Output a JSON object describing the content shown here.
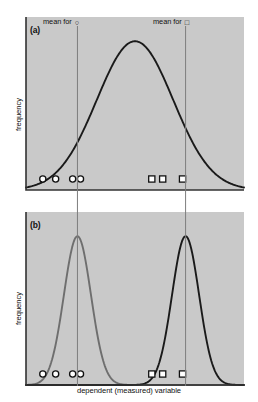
{
  "figure": {
    "background": "#ffffff",
    "panel_fill": "#c9c9c9",
    "axis_color": "#333333",
    "mean_line_color": "#7d7d7d",
    "curve_dark": "#1a1a1a",
    "curve_gray": "#6e6e6e"
  },
  "labels": {
    "panel_a": "(a)",
    "panel_b": "(b)",
    "mean_for_circle": "mean for",
    "mean_for_square": "mean for",
    "circle_glyph": "○",
    "square_glyph": "□",
    "ylabel_a": "frequency",
    "ylabel_b": "frequency",
    "xlabel": "dependent (measured) variable"
  },
  "chart_data": {
    "type": "line",
    "title": "",
    "xlabel": "dependent (measured) variable",
    "ylabel": "frequency",
    "grid": false,
    "legend_position": "none",
    "axis_ticks": false,
    "panels": [
      {
        "id": "a",
        "label": "(a)",
        "description": "Single broad normal distribution; both groups overlap heavily so group means differ but distributions are indistinguishable.",
        "curves": [
          {
            "name": "combined-distribution",
            "color": "#1a1a1a",
            "shape": "normal",
            "mean_x": 0.5,
            "sd_x": 0.175,
            "peak_height": 0.86
          }
        ],
        "mean_lines": [
          {
            "name": "mean-for-circle",
            "x": 0.236,
            "group": "circle"
          },
          {
            "name": "mean-for-square",
            "x": 0.732,
            "group": "square"
          }
        ],
        "observations": [
          {
            "group": "circle",
            "symbol": "○",
            "x": 0.077
          },
          {
            "group": "circle",
            "symbol": "○",
            "x": 0.136
          },
          {
            "group": "circle",
            "symbol": "○",
            "x": 0.214
          },
          {
            "group": "circle",
            "symbol": "○",
            "x": 0.25
          },
          {
            "group": "square",
            "symbol": "□",
            "x": 0.577
          },
          {
            "group": "square",
            "symbol": "□",
            "x": 0.627
          },
          {
            "group": "square",
            "symbol": "□",
            "x": 0.718
          }
        ]
      },
      {
        "id": "b",
        "label": "(b)",
        "description": "Two narrow, well-separated normal distributions; the same group means now correspond to clearly distinct distributions.",
        "curves": [
          {
            "name": "circle-group-distribution",
            "color": "#6e6e6e",
            "shape": "normal",
            "mean_x": 0.236,
            "sd_x": 0.062,
            "peak_height": 0.86
          },
          {
            "name": "square-group-distribution",
            "color": "#1a1a1a",
            "shape": "normal",
            "mean_x": 0.732,
            "sd_x": 0.062,
            "peak_height": 0.86
          }
        ],
        "mean_lines": [
          {
            "name": "mean-for-circle",
            "x": 0.236,
            "group": "circle"
          },
          {
            "name": "mean-for-square",
            "x": 0.732,
            "group": "square"
          }
        ],
        "observations": [
          {
            "group": "circle",
            "symbol": "○",
            "x": 0.077
          },
          {
            "group": "circle",
            "symbol": "○",
            "x": 0.136
          },
          {
            "group": "circle",
            "symbol": "○",
            "x": 0.214
          },
          {
            "group": "circle",
            "symbol": "○",
            "x": 0.25
          },
          {
            "group": "square",
            "symbol": "□",
            "x": 0.577
          },
          {
            "group": "square",
            "symbol": "□",
            "x": 0.627
          },
          {
            "group": "square",
            "symbol": "□",
            "x": 0.718
          }
        ]
      }
    ]
  }
}
